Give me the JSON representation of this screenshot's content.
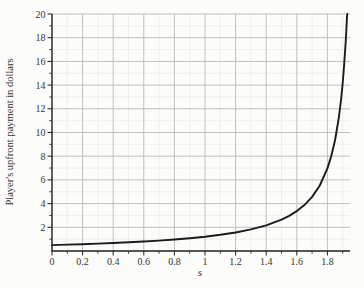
{
  "chart_data": {
    "type": "line",
    "title": "",
    "xlabel": "s",
    "ylabel": "Player's upfront payment in dollars",
    "xlim": [
      0,
      1.95
    ],
    "ylim": [
      0,
      20
    ],
    "x_major_ticks": [
      0,
      0.2,
      0.4,
      0.6,
      0.8,
      1,
      1.2,
      1.4,
      1.6,
      1.8
    ],
    "x_tick_labels": [
      "0",
      "0.2",
      "0.4",
      "0.6",
      "0.8",
      "1",
      "1.2",
      "1.4",
      "1.6",
      "1.8"
    ],
    "x_minor_ticks": [
      0.1,
      0.3,
      0.5,
      0.7,
      0.9,
      1.1,
      1.3,
      1.5,
      1.7,
      1.9
    ],
    "y_major_ticks": [
      2,
      4,
      6,
      8,
      10,
      12,
      14,
      16,
      18,
      20
    ],
    "y_tick_labels": [
      "2",
      "4",
      "6",
      "8",
      "10",
      "12",
      "14",
      "16",
      "18",
      "20"
    ],
    "y_minor_ticks": [
      1,
      3,
      5,
      7,
      9,
      11,
      13,
      15,
      17,
      19
    ],
    "grid": "major and minor, on",
    "legend": "none",
    "series": [
      {
        "name": "upfront-payment-curve",
        "points": [
          [
            0,
            0.5
          ],
          [
            0.1,
            0.537
          ],
          [
            0.2,
            0.577
          ],
          [
            0.3,
            0.623
          ],
          [
            0.4,
            0.675
          ],
          [
            0.5,
            0.733
          ],
          [
            0.6,
            0.801
          ],
          [
            0.7,
            0.878
          ],
          [
            0.8,
            0.97
          ],
          [
            0.9,
            1.077
          ],
          [
            1.0,
            1.207
          ],
          [
            1.1,
            1.366
          ],
          [
            1.2,
            1.565
          ],
          [
            1.3,
            1.821
          ],
          [
            1.4,
            2.163
          ],
          [
            1.5,
            2.643
          ],
          [
            1.55,
            2.962
          ],
          [
            1.6,
            3.363
          ],
          [
            1.65,
            3.877
          ],
          [
            1.7,
            4.562
          ],
          [
            1.75,
            5.524
          ],
          [
            1.8,
            6.968
          ],
          [
            1.825,
            8.0
          ],
          [
            1.85,
            9.37
          ],
          [
            1.875,
            11.29
          ],
          [
            1.89,
            12.87
          ],
          [
            1.9,
            14.18
          ],
          [
            1.91,
            15.78
          ],
          [
            1.92,
            17.78
          ],
          [
            1.928,
            19.79
          ],
          [
            1.93,
            20.0
          ]
        ]
      }
    ],
    "colors": {
      "curve": "#1b1b1b",
      "axis": "#1f1f1d",
      "major_grid": "#b9b9b7",
      "minor_grid": "#e9e9e6",
      "text": "#34342f",
      "background": "#fcfcfa"
    }
  }
}
